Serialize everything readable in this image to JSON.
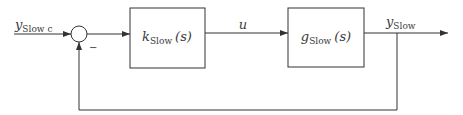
{
  "diagram": {
    "type": "feedback-control-loop",
    "input_signal": {
      "main": "y",
      "sub": "Slow c"
    },
    "summing_junction": {
      "feedback_sign": "−"
    },
    "controller_block": {
      "main": "k",
      "sub": "Slow",
      "arg": "(s)"
    },
    "control_signal": {
      "label": "u"
    },
    "plant_block": {
      "main": "g",
      "sub": "Slow",
      "arg": "(s)"
    },
    "output_signal": {
      "main": "y",
      "sub": "Slow"
    },
    "colors": {
      "stroke": "#333333",
      "text": "#3a3a3a",
      "background": "#ffffff"
    }
  }
}
